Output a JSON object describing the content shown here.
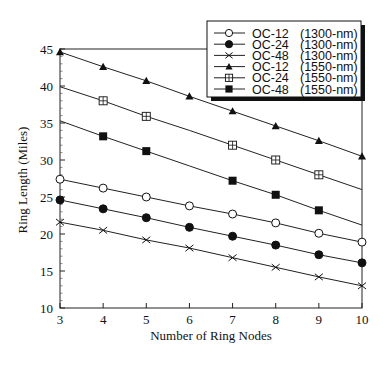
{
  "chart_data": {
    "type": "line",
    "title": "",
    "xlabel": "Number of Ring Nodes",
    "ylabel": "Ring Length (Miles)",
    "x": [
      3,
      4,
      5,
      6,
      7,
      8,
      9,
      10
    ],
    "xlim": [
      3,
      10
    ],
    "ylim": [
      10,
      45
    ],
    "xticks": [
      3,
      4,
      5,
      6,
      7,
      8,
      9,
      10
    ],
    "yticks": [
      10,
      15,
      20,
      25,
      30,
      35,
      40,
      45
    ],
    "grid": false,
    "legend_position": "upper right",
    "series": [
      {
        "name": "OC-12 (1300-nm)",
        "rate": "OC-12",
        "wavelength": "(1300-nm)",
        "marker": "open-circle",
        "values": [
          27.4,
          26.2,
          25.0,
          23.8,
          22.7,
          21.5,
          20.1,
          18.9
        ],
        "marked": [
          true,
          true,
          true,
          true,
          true,
          true,
          true,
          true
        ]
      },
      {
        "name": "OC-24 (1300-nm)",
        "rate": "OC-24",
        "wavelength": "(1300-nm)",
        "marker": "filled-circle",
        "values": [
          24.6,
          23.4,
          22.2,
          20.9,
          19.7,
          18.5,
          17.2,
          16.1
        ],
        "marked": [
          true,
          true,
          true,
          true,
          true,
          true,
          true,
          true
        ]
      },
      {
        "name": "OC-48 (1300-nm)",
        "rate": "OC-48",
        "wavelength": "(1300-nm)",
        "marker": "x",
        "values": [
          21.6,
          20.5,
          19.2,
          18.1,
          16.8,
          15.5,
          14.2,
          13.0
        ],
        "marked": [
          true,
          true,
          true,
          true,
          true,
          true,
          true,
          true
        ]
      },
      {
        "name": "OC-12 (1550-nm)",
        "rate": "OC-12",
        "wavelength": "(1550-nm)",
        "marker": "filled-triangle",
        "values": [
          44.6,
          42.6,
          40.7,
          38.6,
          36.6,
          34.6,
          32.6,
          30.5
        ],
        "marked": [
          true,
          true,
          true,
          true,
          true,
          true,
          true,
          true
        ]
      },
      {
        "name": "OC-24 (1550-nm)",
        "rate": "OC-24",
        "wavelength": "(1550-nm)",
        "marker": "open-square-plus",
        "values": [
          39.9,
          38.0,
          35.9,
          34.0,
          32.0,
          30.0,
          28.0,
          26.0
        ],
        "marked": [
          false,
          true,
          true,
          false,
          true,
          true,
          true,
          false
        ]
      },
      {
        "name": "OC-48 (1550-nm)",
        "rate": "OC-48",
        "wavelength": "(1550-nm)",
        "marker": "filled-square",
        "values": [
          35.3,
          33.2,
          31.2,
          29.2,
          27.2,
          25.3,
          23.2,
          21.2
        ],
        "marked": [
          false,
          true,
          true,
          false,
          true,
          true,
          true,
          false
        ]
      }
    ]
  }
}
